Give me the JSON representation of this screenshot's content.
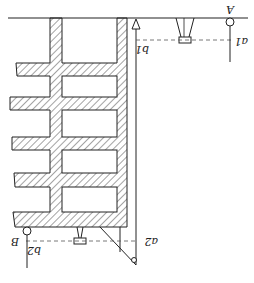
{
  "diagram": {
    "orientation": "rotated-180",
    "labels": {
      "point_a": "A",
      "point_b": "B",
      "reading_a1": "a1",
      "reading_b1": "b1",
      "reading_a2": "a2",
      "reading_b2": "b2"
    },
    "colors": {
      "line": "#222222",
      "hatch": "#333333",
      "background": "#ffffff"
    }
  }
}
